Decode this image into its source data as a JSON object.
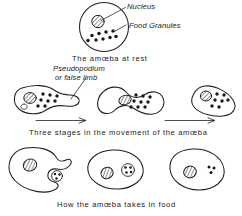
{
  "figure": {
    "ink_color": "#231f1c",
    "background_color": "#ffffff",
    "panels": [
      {
        "id": "rest",
        "caption": "The amœba at rest",
        "labels": [
          {
            "name": "nucleus",
            "text": "Nucleus"
          },
          {
            "name": "food-granules",
            "text": "Food Granules"
          }
        ],
        "cell_count": 1,
        "granule_count": 9
      },
      {
        "id": "movement",
        "caption": "Three stages in the movement of the amœba",
        "labels": [
          {
            "name": "pseudopodium-line1",
            "text": "Pseudopodium"
          },
          {
            "name": "pseudopodium-line2",
            "text": "or false limb"
          }
        ],
        "cell_count": 3,
        "arrow_count": 2
      },
      {
        "id": "feeding",
        "caption": "How the amœba takes in food",
        "labels": [],
        "cell_count": 3,
        "arrow_count": 0
      }
    ]
  },
  "text": {
    "label_nucleus": "Nucleus",
    "label_food_granules": "Food Granules",
    "label_pseudopodium_1": "Pseudopodium",
    "label_pseudopodium_2": "or false limb",
    "caption_rest": "The amœba at rest",
    "caption_movement": "Three stages in the movement of the amœba",
    "caption_feeding": "How the amœba takes in food"
  }
}
